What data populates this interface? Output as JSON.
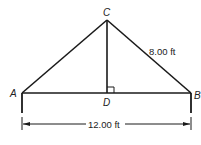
{
  "diagram": {
    "points": {
      "A": {
        "label": "A"
      },
      "B": {
        "label": "B"
      },
      "C": {
        "label": "C"
      },
      "D": {
        "label": "D"
      }
    },
    "side_label": "8.00 ft",
    "base_label": "12.00 ft",
    "right_angle_at": "D",
    "line_color": "#1a1a1a"
  }
}
